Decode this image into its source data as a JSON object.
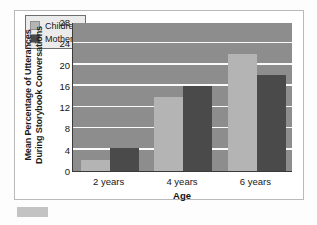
{
  "chart_data": {
    "type": "bar",
    "title": "",
    "subtitle": "",
    "xlabel": "Age",
    "ylabel": "Mean Percentage of Utterances During Storybook Conversations",
    "ylabel_lines": [
      "Mean Percentage of Utterances",
      "During Storybook Conversations"
    ],
    "categories": [
      "2 years",
      "4 years",
      "6 years"
    ],
    "series": [
      {
        "name": "Children",
        "color": "#b4b4b4",
        "values": [
          2,
          14,
          22
        ]
      },
      {
        "name": "Mothers",
        "color": "#4a4a4a",
        "values": [
          4.3,
          16,
          18
        ]
      }
    ],
    "ylim": [
      0,
      28
    ],
    "ytick_values": [
      0,
      4,
      8,
      12,
      16,
      20,
      24,
      28
    ],
    "ytick_labels": [
      "0",
      "4",
      "8",
      "12",
      "16",
      "20",
      "24",
      "28"
    ],
    "grid": "horizontal",
    "grid_color": "#fafafa",
    "plot_background": "#8d8d8d",
    "legend_position": "top-left",
    "legend": [
      {
        "label": "Children",
        "color": "#b4b4b4"
      },
      {
        "label": "Mothers",
        "color": "#4a4a4a"
      }
    ]
  }
}
